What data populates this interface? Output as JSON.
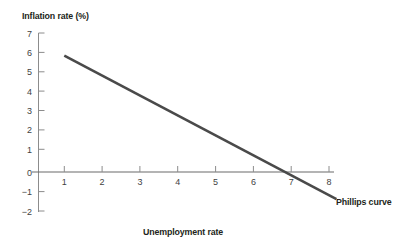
{
  "chart_data": {
    "type": "line",
    "title": "",
    "xlabel": "Unemployment rate",
    "ylabel": "Inflation rate (%)",
    "xlim": [
      0,
      8.5
    ],
    "ylim": [
      -2,
      7
    ],
    "grid": false,
    "legend_position": "inline-end-of-line",
    "x_ticks": [
      "1",
      "2",
      "3",
      "4",
      "5",
      "6",
      "7",
      "8"
    ],
    "x_tick_values": [
      1,
      2,
      3,
      4,
      5,
      6,
      7,
      8
    ],
    "y_ticks": [
      "7",
      "6",
      "5",
      "4",
      "3",
      "2",
      "1",
      "0",
      "−1",
      "−2"
    ],
    "y_tick_values": [
      7,
      6,
      5,
      4,
      3,
      2,
      1,
      0,
      -1,
      -2
    ],
    "series": [
      {
        "name": "Phillips curve",
        "color": "#4a4a4a",
        "points": [
          {
            "x": 1.0,
            "y": 6.0
          },
          {
            "x": 8.2,
            "y": -1.4
          }
        ],
        "x": [
          1.0,
          8.2
        ],
        "values": [
          6.0,
          -1.4
        ],
        "annotation": "Phillips curve"
      }
    ],
    "annotations": [
      {
        "text": "Phillips curve",
        "x": 8.3,
        "y": -1.7
      }
    ]
  },
  "axes": {
    "y_title": "Inflation rate (%)",
    "x_title": "Unemployment rate"
  },
  "series_labels": {
    "phillips_curve": "Phillips curve"
  },
  "colors": {
    "background": "#ffffff",
    "line": "#4a4a4a",
    "axis": "#8c8c8c",
    "axis_x": "#6b6b6b",
    "text": "#231f20",
    "tick_text": "#3f3f3f"
  }
}
